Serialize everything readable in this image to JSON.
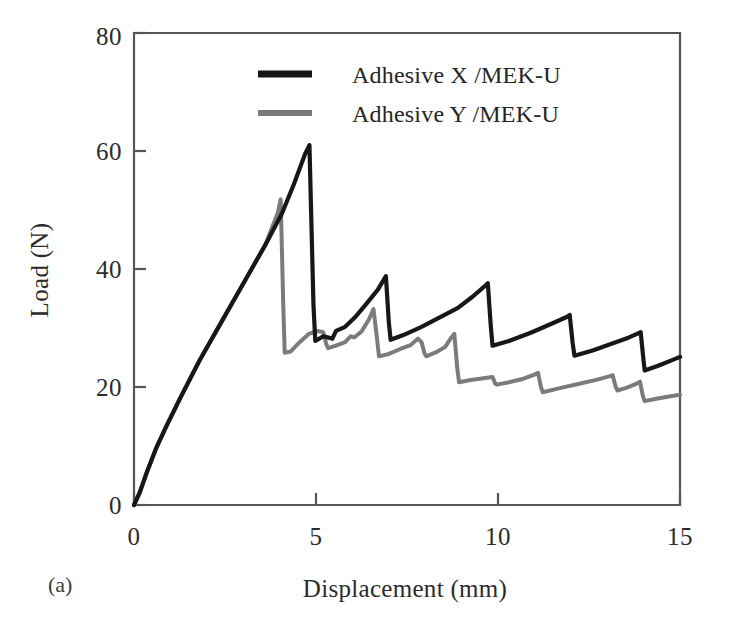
{
  "figure": {
    "panel_label": "(a)",
    "background_color": "#ffffff"
  },
  "chart_data": {
    "type": "line",
    "title": "",
    "xlabel": "Displacement (mm)",
    "ylabel": "Load (N)",
    "xlim": [
      0,
      15
    ],
    "ylim": [
      0,
      80
    ],
    "xticks": [
      0,
      5,
      10,
      15
    ],
    "yticks": [
      0,
      20,
      40,
      60,
      80
    ],
    "xtick_labels": [
      "0",
      "5",
      "10",
      "15"
    ],
    "ytick_labels": [
      "0",
      "20",
      "40",
      "60",
      "80"
    ],
    "grid": false,
    "legend_position": "upper-center",
    "series": [
      {
        "name": "Adhesive X /MEK-U",
        "color": "#171717",
        "line_width": 4.2,
        "points": [
          [
            0.0,
            0.0
          ],
          [
            0.15,
            2.0
          ],
          [
            0.35,
            5.5
          ],
          [
            0.6,
            9.5
          ],
          [
            0.9,
            13.5
          ],
          [
            1.3,
            18.5
          ],
          [
            1.8,
            24.5
          ],
          [
            2.4,
            31.0
          ],
          [
            3.0,
            37.5
          ],
          [
            3.6,
            44.0
          ],
          [
            4.07,
            49.5
          ],
          [
            4.4,
            54.5
          ],
          [
            4.7,
            59.5
          ],
          [
            4.82,
            61.0
          ],
          [
            4.93,
            34.0
          ],
          [
            4.98,
            27.8
          ],
          [
            5.2,
            28.6
          ],
          [
            5.45,
            28.2
          ],
          [
            5.55,
            29.5
          ],
          [
            5.8,
            30.2
          ],
          [
            6.1,
            32.0
          ],
          [
            6.4,
            34.2
          ],
          [
            6.7,
            36.5
          ],
          [
            6.92,
            38.8
          ],
          [
            7.0,
            31.0
          ],
          [
            7.05,
            28.0
          ],
          [
            7.4,
            28.8
          ],
          [
            7.9,
            30.2
          ],
          [
            8.4,
            31.8
          ],
          [
            8.9,
            33.4
          ],
          [
            9.3,
            35.3
          ],
          [
            9.62,
            37.0
          ],
          [
            9.72,
            37.6
          ],
          [
            9.8,
            30.5
          ],
          [
            9.85,
            27.0
          ],
          [
            10.3,
            27.8
          ],
          [
            10.9,
            29.2
          ],
          [
            11.5,
            30.8
          ],
          [
            11.9,
            31.9
          ],
          [
            11.97,
            32.2
          ],
          [
            12.05,
            27.5
          ],
          [
            12.1,
            25.3
          ],
          [
            12.6,
            26.2
          ],
          [
            13.1,
            27.3
          ],
          [
            13.6,
            28.4
          ],
          [
            13.85,
            29.1
          ],
          [
            13.92,
            29.3
          ],
          [
            13.99,
            25.0
          ],
          [
            14.03,
            22.8
          ],
          [
            14.4,
            23.6
          ],
          [
            14.8,
            24.6
          ],
          [
            15.0,
            25.1
          ]
        ]
      },
      {
        "name": "Adhesive Y /MEK-U",
        "color": "#7b7b7b",
        "line_width": 4.0,
        "points": [
          [
            0.0,
            0.0
          ],
          [
            0.15,
            2.0
          ],
          [
            0.35,
            5.5
          ],
          [
            0.6,
            9.5
          ],
          [
            0.9,
            13.5
          ],
          [
            1.3,
            18.5
          ],
          [
            1.8,
            24.5
          ],
          [
            2.4,
            31.0
          ],
          [
            3.0,
            37.5
          ],
          [
            3.6,
            44.0
          ],
          [
            3.95,
            49.5
          ],
          [
            4.03,
            51.8
          ],
          [
            4.1,
            34.0
          ],
          [
            4.14,
            25.8
          ],
          [
            4.3,
            26.0
          ],
          [
            4.55,
            27.6
          ],
          [
            4.8,
            29.0
          ],
          [
            5.05,
            29.5
          ],
          [
            5.2,
            29.3
          ],
          [
            5.28,
            27.3
          ],
          [
            5.33,
            26.6
          ],
          [
            5.55,
            27.0
          ],
          [
            5.8,
            27.6
          ],
          [
            5.95,
            28.6
          ],
          [
            6.05,
            28.4
          ],
          [
            6.25,
            29.4
          ],
          [
            6.45,
            31.4
          ],
          [
            6.58,
            33.2
          ],
          [
            6.68,
            28.0
          ],
          [
            6.73,
            25.2
          ],
          [
            7.0,
            25.6
          ],
          [
            7.3,
            26.4
          ],
          [
            7.6,
            27.1
          ],
          [
            7.8,
            28.2
          ],
          [
            7.9,
            27.6
          ],
          [
            7.98,
            25.7
          ],
          [
            8.03,
            25.2
          ],
          [
            8.3,
            25.9
          ],
          [
            8.55,
            26.8
          ],
          [
            8.72,
            28.4
          ],
          [
            8.8,
            29.0
          ],
          [
            8.88,
            23.2
          ],
          [
            8.93,
            20.8
          ],
          [
            9.25,
            21.2
          ],
          [
            9.6,
            21.5
          ],
          [
            9.85,
            21.7
          ],
          [
            9.92,
            20.6
          ],
          [
            9.97,
            20.4
          ],
          [
            10.3,
            20.8
          ],
          [
            10.7,
            21.4
          ],
          [
            11.0,
            22.1
          ],
          [
            11.1,
            22.4
          ],
          [
            11.18,
            20.0
          ],
          [
            11.23,
            19.1
          ],
          [
            11.7,
            19.8
          ],
          [
            12.2,
            20.5
          ],
          [
            12.7,
            21.2
          ],
          [
            13.05,
            21.8
          ],
          [
            13.15,
            22.0
          ],
          [
            13.23,
            20.1
          ],
          [
            13.28,
            19.4
          ],
          [
            13.5,
            19.8
          ],
          [
            13.75,
            20.4
          ],
          [
            13.9,
            20.9
          ],
          [
            13.98,
            18.5
          ],
          [
            14.03,
            17.6
          ],
          [
            14.35,
            18.0
          ],
          [
            14.7,
            18.4
          ],
          [
            15.0,
            18.7
          ]
        ]
      }
    ]
  },
  "legend": {
    "entries": [
      {
        "label": "Adhesive X /MEK-U",
        "color": "#171717",
        "swatch": "thick-line-swatch"
      },
      {
        "label": "Adhesive Y /MEK-U",
        "color": "#7b7b7b",
        "swatch": "thick-line-swatch"
      }
    ]
  }
}
